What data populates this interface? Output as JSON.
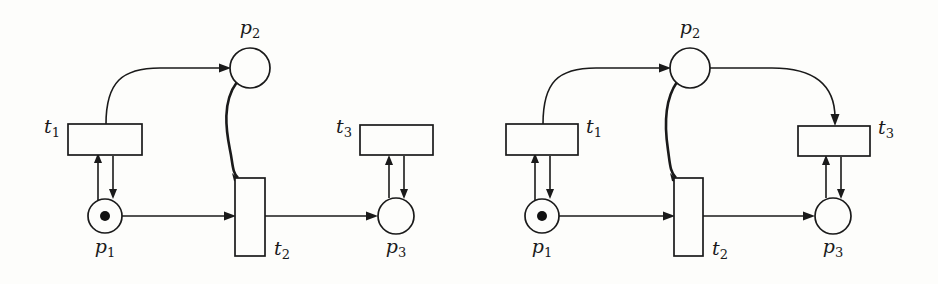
{
  "figure": {
    "kind": "petri-net-pair",
    "background_color": "#fdfdfb",
    "stroke_color": "#1a1a1a",
    "token_color": "#111111"
  },
  "diagrams": [
    {
      "id": "left-petri-net",
      "name": "left-diagram",
      "places": [
        {
          "id": "p1",
          "label_base": "p",
          "label_sub": "1",
          "label": "p1",
          "cx": 105,
          "cy": 216,
          "r": 17,
          "tokens": 1,
          "label_x": 105,
          "label_y": 253,
          "label_anchor": "middle"
        },
        {
          "id": "p2",
          "label_base": "p",
          "label_sub": "2",
          "label": "p2",
          "cx": 250,
          "cy": 68,
          "r": 20,
          "tokens": 0,
          "label_x": 250,
          "label_y": 34,
          "label_anchor": "middle"
        },
        {
          "id": "p3",
          "label_base": "p",
          "label_sub": "3",
          "label": "p3",
          "cx": 396,
          "cy": 216,
          "r": 18,
          "tokens": 0,
          "label_x": 396,
          "label_y": 253,
          "label_anchor": "middle"
        }
      ],
      "transitions": [
        {
          "id": "t1",
          "label_base": "t",
          "label_sub": "1",
          "label": "t1",
          "x": 68,
          "y": 124,
          "w": 74,
          "h": 31,
          "label_x": 60,
          "label_y": 133,
          "label_anchor": "end"
        },
        {
          "id": "t2",
          "label_base": "t",
          "label_sub": "2",
          "label": "t2",
          "x": 235,
          "y": 178,
          "w": 30,
          "h": 78,
          "label_x": 274,
          "label_y": 255,
          "label_anchor": "start"
        },
        {
          "id": "t3",
          "label_base": "t",
          "label_sub": "3",
          "label": "t3",
          "x": 360,
          "y": 125,
          "w": 73,
          "h": 30,
          "label_x": 352,
          "label_y": 133,
          "label_anchor": "end"
        }
      ],
      "arcs": [
        {
          "id": "p1-to-t1",
          "from": "p1",
          "to": "t1",
          "type": "straight-up"
        },
        {
          "id": "t1-to-p1",
          "from": "t1",
          "to": "p1",
          "type": "straight-down"
        },
        {
          "id": "t1-to-p2",
          "from": "t1",
          "to": "p2",
          "type": "curved-up-right"
        },
        {
          "id": "p2-to-t2",
          "from": "p2",
          "to": "t2",
          "type": "curved-down-thick"
        },
        {
          "id": "p1-to-t2",
          "from": "p1",
          "to": "t2",
          "type": "horizontal"
        },
        {
          "id": "t2-to-p3",
          "from": "t2",
          "to": "p3",
          "type": "horizontal"
        },
        {
          "id": "p3-to-t3",
          "from": "p3",
          "to": "t3",
          "type": "straight-up"
        },
        {
          "id": "t3-to-p3",
          "from": "t3",
          "to": "p3",
          "type": "straight-down"
        }
      ]
    },
    {
      "id": "right-petri-net",
      "name": "right-diagram",
      "places": [
        {
          "id": "p1",
          "label_base": "p",
          "label_sub": "1",
          "label": "p1",
          "cx": 542,
          "cy": 216,
          "r": 17,
          "tokens": 1,
          "label_x": 542,
          "label_y": 253,
          "label_anchor": "middle"
        },
        {
          "id": "p2",
          "label_base": "p",
          "label_sub": "2",
          "label": "p2",
          "cx": 690,
          "cy": 68,
          "r": 20,
          "tokens": 0,
          "label_x": 690,
          "label_y": 34,
          "label_anchor": "middle"
        },
        {
          "id": "p3",
          "label_base": "p",
          "label_sub": "3",
          "label": "p3",
          "cx": 833,
          "cy": 216,
          "r": 18,
          "tokens": 0,
          "label_x": 833,
          "label_y": 253,
          "label_anchor": "middle"
        }
      ],
      "transitions": [
        {
          "id": "t1",
          "label_base": "t",
          "label_sub": "1",
          "label": "t1",
          "x": 506,
          "y": 124,
          "w": 72,
          "h": 31,
          "label_x": 586,
          "label_y": 133,
          "label_anchor": "start"
        },
        {
          "id": "t2",
          "label_base": "t",
          "label_sub": "2",
          "label": "t2",
          "x": 674,
          "y": 178,
          "w": 29,
          "h": 78,
          "label_x": 712,
          "label_y": 255,
          "label_anchor": "start"
        },
        {
          "id": "t3",
          "label_base": "t",
          "label_sub": "3",
          "label": "t3",
          "x": 798,
          "y": 126,
          "w": 72,
          "h": 30,
          "label_x": 878,
          "label_y": 134,
          "label_anchor": "start"
        }
      ],
      "arcs": [
        {
          "id": "p1-to-t1",
          "from": "p1",
          "to": "t1",
          "type": "straight-up"
        },
        {
          "id": "t1-to-p1",
          "from": "t1",
          "to": "p1",
          "type": "straight-down"
        },
        {
          "id": "t1-to-p2",
          "from": "t1",
          "to": "p2",
          "type": "curved-up-right"
        },
        {
          "id": "p2-to-t2",
          "from": "p2",
          "to": "t2",
          "type": "curved-down-thick"
        },
        {
          "id": "p2-to-t3",
          "from": "p2",
          "to": "t3",
          "type": "curved-right-down"
        },
        {
          "id": "p1-to-t2",
          "from": "p1",
          "to": "t2",
          "type": "horizontal"
        },
        {
          "id": "t2-to-p3",
          "from": "t2",
          "to": "p3",
          "type": "horizontal"
        },
        {
          "id": "p3-to-t3",
          "from": "p3",
          "to": "t3",
          "type": "straight-up"
        },
        {
          "id": "t3-to-p3",
          "from": "t3",
          "to": "p3",
          "type": "straight-down"
        }
      ]
    }
  ]
}
